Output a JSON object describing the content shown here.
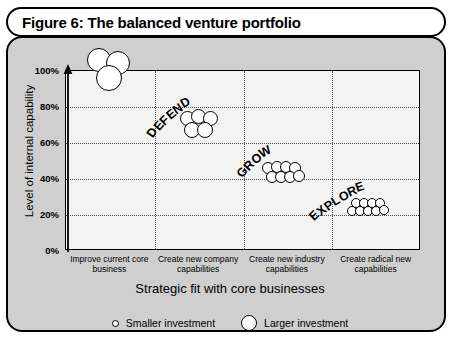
{
  "figure": {
    "title": "Figure 6: The balanced venture portfolio"
  },
  "legend": {
    "position": "bottom",
    "items": [
      {
        "label": "Smaller investment",
        "marker": "small-circle-icon"
      },
      {
        "label": "Larger investment",
        "marker": "large-circle-icon"
      }
    ]
  },
  "zones": [
    {
      "label": "DEFEND",
      "angle": -42,
      "x": 148,
      "y": 128
    },
    {
      "label": "GROW",
      "angle": -42,
      "x": 238,
      "y": 168
    },
    {
      "label": "EXPLORE",
      "angle": -32,
      "x": 310,
      "y": 210
    }
  ],
  "colors": {
    "panel_background": "#cfcfcf",
    "plot_background": "#f3f3f3",
    "line": "#000000",
    "grid": "#4a4a4a",
    "bubble_fill": "#ffffff"
  },
  "chart_data": {
    "type": "scatter",
    "title": "Figure 6: The balanced venture portfolio",
    "xlabel": "Strategic fit with core businesses",
    "ylabel": "Level of internal capability",
    "grid": true,
    "ylim": [
      0,
      100
    ],
    "yticks": [
      "0%",
      "20%",
      "40%",
      "60%",
      "80%",
      "100%"
    ],
    "categories": [
      "Improve current core business",
      "Create new company capabilities",
      "Create new industry capabilities",
      "Create radical new capabilities"
    ],
    "note": "Bubble size encodes investment size: larger circle = larger investment, smaller circle = smaller investment.",
    "series": [
      {
        "name": "Defend cluster",
        "category": "Improve current core business",
        "zone": "DEFEND",
        "approx_y_percent": 88,
        "bubble_count": 3,
        "bubble_size": "large",
        "points": [
          {
            "x": 99,
            "y": 60,
            "d": 24
          },
          {
            "x": 118,
            "y": 63,
            "d": 24
          },
          {
            "x": 109,
            "y": 78,
            "d": 26
          }
        ]
      },
      {
        "name": "Grow cluster A",
        "category": "Create new company capabilities",
        "zone": "GROW",
        "approx_y_percent": 64,
        "bubble_count": 5,
        "bubble_size": "medium",
        "points": [
          {
            "x": 187,
            "y": 118,
            "d": 15
          },
          {
            "x": 198,
            "y": 116,
            "d": 15
          },
          {
            "x": 210,
            "y": 118,
            "d": 15
          },
          {
            "x": 192,
            "y": 130,
            "d": 16
          },
          {
            "x": 205,
            "y": 130,
            "d": 16
          }
        ]
      },
      {
        "name": "Grow cluster B",
        "category": "Create new industry capabilities",
        "zone": "GROW",
        "approx_y_percent": 50,
        "bubble_count": 8,
        "bubble_size": "small",
        "points": [
          {
            "x": 268,
            "y": 168,
            "d": 12
          },
          {
            "x": 277,
            "y": 167,
            "d": 12
          },
          {
            "x": 286,
            "y": 167,
            "d": 12
          },
          {
            "x": 295,
            "y": 168,
            "d": 12
          },
          {
            "x": 272,
            "y": 177,
            "d": 12
          },
          {
            "x": 281,
            "y": 177,
            "d": 12
          },
          {
            "x": 290,
            "y": 177,
            "d": 12
          },
          {
            "x": 299,
            "y": 176,
            "d": 12
          }
        ]
      },
      {
        "name": "Explore cluster",
        "category": "Create radical new capabilities",
        "zone": "EXPLORE",
        "approx_y_percent": 22,
        "bubble_count": 9,
        "bubble_size": "small",
        "points": [
          {
            "x": 356,
            "y": 203,
            "d": 10
          },
          {
            "x": 364,
            "y": 203,
            "d": 10
          },
          {
            "x": 372,
            "y": 203,
            "d": 10
          },
          {
            "x": 380,
            "y": 203,
            "d": 10
          },
          {
            "x": 352,
            "y": 211,
            "d": 10
          },
          {
            "x": 360,
            "y": 211,
            "d": 10
          },
          {
            "x": 368,
            "y": 211,
            "d": 10
          },
          {
            "x": 376,
            "y": 211,
            "d": 10
          },
          {
            "x": 384,
            "y": 210,
            "d": 10
          }
        ]
      }
    ]
  }
}
